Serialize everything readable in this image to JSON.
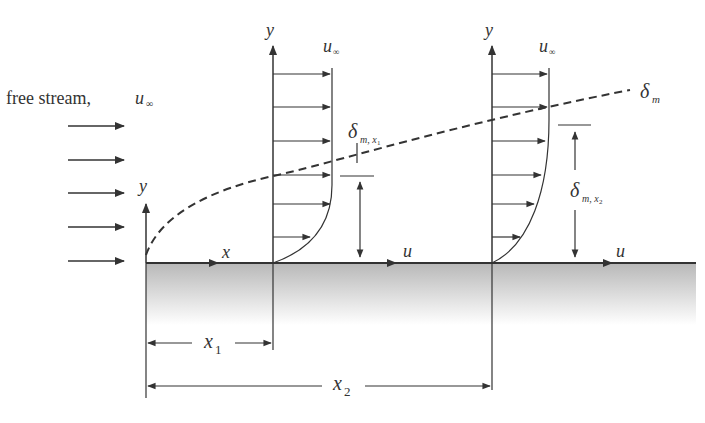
{
  "diagram": {
    "free_stream_label": "free stream,",
    "free_stream_symbol": "u",
    "infinity": "∞",
    "axis_y": "y",
    "axis_x": "x",
    "axis_u": "u",
    "delta": "δ",
    "delta_sub_m": "m",
    "delta_sub_x1": "m, x",
    "x1_label": "x",
    "x1_sub": "1",
    "x2_label": "x",
    "x2_sub": "2",
    "profiles": [
      {
        "position": "x1",
        "edge_label": "u∞",
        "thickness_label": "δ_m,x1"
      },
      {
        "position": "x2",
        "edge_label": "u∞",
        "thickness_label": "δ_m,x2"
      }
    ],
    "boundary_layer_label": "δm",
    "colors": {
      "line": "#333333",
      "plate_top": "#b8b8b8",
      "plate_bottom": "#ffffff"
    }
  }
}
